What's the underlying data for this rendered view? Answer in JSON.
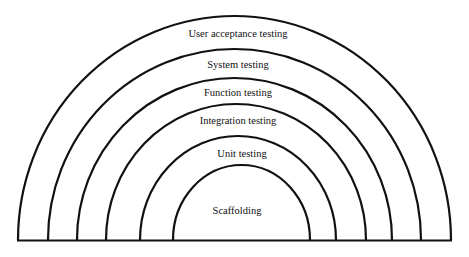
{
  "diagram": {
    "type": "nested-semicircles",
    "stroke_color": "#111111",
    "background": "#ffffff",
    "layers_outer_to_inner": [
      {
        "label": "User acceptance testing"
      },
      {
        "label": "System testing"
      },
      {
        "label": "Function testing"
      },
      {
        "label": "Integration testing"
      },
      {
        "label": "Unit testing"
      },
      {
        "label": "Scaffolding"
      }
    ]
  }
}
